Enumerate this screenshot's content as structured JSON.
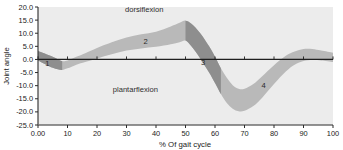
{
  "chart_data": {
    "type": "area",
    "title": "",
    "xlabel": "% Of gait cycle",
    "ylabel": "Joint angle",
    "xlim": [
      0,
      100
    ],
    "ylim": [
      -25,
      20
    ],
    "grid": false,
    "legend_position": "none",
    "x_ticks": [
      "0.00",
      "10",
      "20",
      "30",
      "40",
      "50",
      "60",
      "70",
      "80",
      "90",
      "100"
    ],
    "x_tick_values": [
      0,
      10,
      20,
      30,
      40,
      50,
      60,
      70,
      80,
      90,
      100
    ],
    "y_ticks": [
      "20.0",
      "15.0",
      "10.0",
      "5.0",
      "0.0",
      "-5.0",
      "-10.0",
      "-15.0",
      "-20.0",
      "-25.0"
    ],
    "y_tick_values": [
      20,
      15,
      10,
      5,
      0,
      -5,
      -10,
      -15,
      -20,
      -25
    ],
    "annotations": [
      {
        "text": "dorsiflexion",
        "x": 36,
        "y": 18.2
      },
      {
        "text": "plantarflexion",
        "x": 33,
        "y": -12.5
      },
      {
        "text": "1",
        "x": 3.2,
        "y": -2.6
      },
      {
        "text": "2",
        "x": 36.5,
        "y": 6.0
      },
      {
        "text": "3",
        "x": 56.0,
        "y": -2.2
      },
      {
        "text": "4",
        "x": 76.5,
        "y": -11.0
      }
    ],
    "series": [
      {
        "name": "ankle angle band - upper bound",
        "x": [
          0,
          5,
          8,
          10,
          13,
          16,
          20,
          25,
          30,
          35,
          40,
          45,
          48,
          50,
          52,
          55,
          58,
          60,
          62,
          64,
          66,
          68,
          70,
          73,
          76,
          80,
          84,
          87,
          90,
          93,
          96,
          100
        ],
        "values": [
          3.2,
          1.0,
          -0.6,
          -0.4,
          1.0,
          2.4,
          4.4,
          6.6,
          8.4,
          9.6,
          10.6,
          12.6,
          14.0,
          14.8,
          13.6,
          10.0,
          5.0,
          1.0,
          -3.4,
          -7.0,
          -9.8,
          -11.2,
          -11.2,
          -9.4,
          -6.4,
          -2.2,
          1.4,
          3.0,
          4.0,
          4.0,
          3.4,
          2.6
        ]
      },
      {
        "name": "ankle angle band - lower bound",
        "x": [
          0,
          5,
          8,
          10,
          13,
          16,
          20,
          25,
          30,
          35,
          40,
          45,
          48,
          50,
          52,
          55,
          58,
          60,
          62,
          64,
          66,
          68,
          70,
          73,
          76,
          80,
          84,
          87,
          90,
          93,
          96,
          100
        ],
        "values": [
          -0.4,
          -3.2,
          -4.0,
          -3.4,
          -2.0,
          -1.0,
          0.4,
          2.0,
          3.4,
          4.2,
          4.8,
          5.8,
          6.6,
          7.2,
          5.0,
          0.4,
          -5.0,
          -9.0,
          -13.2,
          -16.6,
          -18.8,
          -19.8,
          -19.6,
          -17.8,
          -14.6,
          -9.4,
          -4.6,
          -2.0,
          -0.6,
          -0.2,
          -0.4,
          -1.0
        ]
      }
    ],
    "phases": [
      {
        "id": "1",
        "name": "controlled plantarflexion",
        "x_start": 0,
        "x_end": 8.2,
        "shade": "dark"
      },
      {
        "id": "2",
        "name": "controlled dorsiflexion",
        "x_start": 8.2,
        "x_end": 50.0,
        "shade": "light"
      },
      {
        "id": "3",
        "name": "powered plantarflexion",
        "x_start": 50.0,
        "x_end": 62.0,
        "shade": "dark"
      },
      {
        "id": "4",
        "name": "swing phase",
        "x_start": 62.0,
        "x_end": 100,
        "shade": "light"
      }
    ],
    "colors": {
      "band_light": "#b9b9b9",
      "band_dark": "#8e8e8e",
      "plot_background": "#ececec",
      "axis": "#2b2b2b",
      "text": "#1b1b1b"
    }
  }
}
